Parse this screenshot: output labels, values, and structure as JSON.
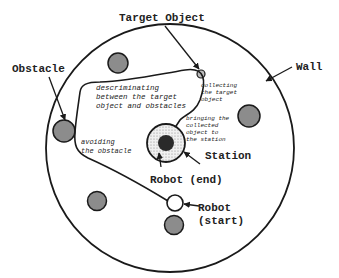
{
  "diagram": {
    "labels": {
      "target_object": "Target Object",
      "obstacle": "Obstacle",
      "wall": "Wall",
      "station": "Station",
      "robot_end": "Robot (end)",
      "robot_start_line1": "Robot",
      "robot_start_line2": "(start)"
    },
    "annotations": {
      "discriminating_1": "descriminating",
      "discriminating_2": "between the target",
      "discriminating_3": "object and obstacles",
      "collecting_1": "collecting",
      "collecting_2": "the target",
      "collecting_3": "object",
      "bringing_1": "bringing the",
      "bringing_2": "collected",
      "bringing_3": "object to",
      "bringing_4": "the station",
      "avoiding_1": "avoiding",
      "avoiding_2": "the obstacle"
    },
    "colors": {
      "stroke": "#1a1a1a",
      "obstacle_fill": "#8c8c8c",
      "station_fill": "#d8d8d8",
      "robot_end_fill": "#2a2a2a",
      "background": "#ffffff"
    }
  }
}
